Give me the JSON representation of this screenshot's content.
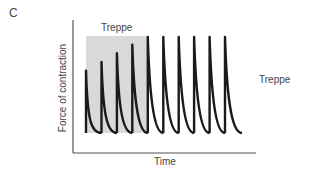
{
  "panel_letter": "C",
  "shaded_region_label": "Treppe",
  "side_label": "Treppe",
  "chart_data": {
    "type": "line",
    "title": "Treppe",
    "xlabel": "Time",
    "ylabel": "Force of contraction",
    "grid": false,
    "legend": null,
    "annotations": [
      "Treppe (shaded region over first 5 twitches)",
      "Treppe (right-side label)"
    ],
    "series": [
      {
        "name": "Twitch force",
        "peak_x_relative": [
          1,
          2,
          3,
          4,
          5,
          6,
          7,
          8,
          9,
          10
        ],
        "peak_force_relative": [
          0.65,
          0.74,
          0.83,
          0.92,
          1.0,
          1.0,
          1.0,
          1.0,
          1.0,
          1.0
        ]
      }
    ],
    "shaded_region": {
      "from_twitch": 1,
      "to_twitch": 5,
      "color": "#d9d9d9"
    },
    "line_color": "#1a1a1a"
  }
}
